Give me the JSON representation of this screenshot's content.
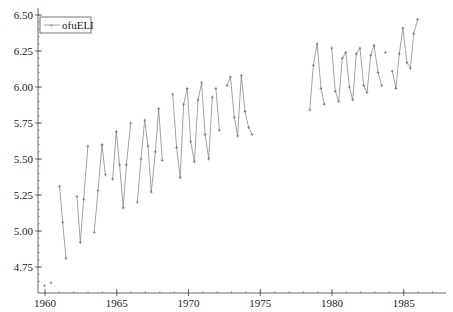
{
  "chart_data": {
    "type": "line",
    "title": "",
    "xlabel": "",
    "ylabel": "",
    "xlim": [
      1959.0,
      1987.6
    ],
    "ylim": [
      4.63,
      6.5
    ],
    "xticks": [
      1960,
      1965,
      1970,
      1975,
      1980,
      1985
    ],
    "xtick_labels": [
      "1960",
      "1965",
      "1970",
      "1975",
      "1980",
      "1985"
    ],
    "yticks": [
      4.75,
      5.0,
      5.25,
      5.5,
      5.75,
      6.0,
      6.25,
      6.5
    ],
    "ytick_labels": [
      "4.75",
      "5.00",
      "5.25",
      "5.50",
      "5.75",
      "6.00",
      "6.25",
      "6.50"
    ],
    "grid": false,
    "legend_position": "upper left",
    "series": [
      {
        "name": "ofuELI",
        "color": "#8a8a8a",
        "marker": "+",
        "segments": [
          {
            "x": [
              1959.96
            ],
            "y": [
              4.62
            ]
          },
          {
            "x": [
              1960.42
            ],
            "y": [
              4.64
            ]
          },
          {
            "x": [
              1961.02,
              1961.23,
              1961.46
            ],
            "y": [
              5.31,
              5.06,
              4.81
            ]
          },
          {
            "x": [
              1962.23,
              1962.46,
              1962.7,
              1962.99
            ],
            "y": [
              5.24,
              4.92,
              5.22,
              5.59
            ]
          },
          {
            "x": [
              1963.43,
              1963.69,
              1963.97,
              1964.21
            ],
            "y": [
              4.99,
              5.28,
              5.6,
              5.39
            ]
          },
          {
            "x": [
              1964.71,
              1964.97,
              1965.2,
              1965.45,
              1965.67,
              1965.97
            ],
            "y": [
              5.36,
              5.69,
              5.46,
              5.16,
              5.46,
              5.75
            ]
          },
          {
            "x": [
              1966.43,
              1966.69,
              1966.95,
              1967.18,
              1967.41,
              1967.69,
              1967.92,
              1968.17
            ],
            "y": [
              5.2,
              5.5,
              5.77,
              5.59,
              5.27,
              5.55,
              5.85,
              5.49
            ]
          },
          {
            "x": [
              1168.9,
              1969.17,
              1969.42,
              1969.66,
              1969.91,
              1970.15,
              1970.41,
              1970.66,
              1970.91,
              1971.16,
              1971.41,
              1971.66
            ],
            "y": [
              5.95,
              5.58,
              5.37,
              5.88,
              5.99,
              5.62,
              5.48,
              5.91,
              6.03,
              5.67,
              5.5,
              5.93
            ]
          },
          {
            "x": [
              1971.91,
              1972.15
            ],
            "y": [
              5.99,
              5.7
            ]
          },
          {
            "x": [
              1972.68,
              1972.92,
              1973.19,
              1973.42,
              1973.68,
              1973.94,
              1974.19,
              1974.43
            ],
            "y": [
              6.01,
              6.07,
              5.79,
              5.66,
              6.08,
              5.83,
              5.72,
              5.67
            ]
          },
          {
            "x": [
              1978.45,
              1978.7,
              1978.97,
              1979.23,
              1979.46
            ],
            "y": [
              5.84,
              6.15,
              6.3,
              5.99,
              5.88
            ]
          },
          {
            "x": [
              1979.98,
              1980.23,
              1980.47,
              1980.72,
              1980.96,
              1981.21,
              1981.44,
              1981.69,
              1981.95,
              1982.21,
              1982.44,
              1982.7,
              1982.93,
              1983.21,
              1983.46
            ],
            "y": [
              6.27,
              5.97,
              5.9,
              6.2,
              6.24,
              6.0,
              5.91,
              6.23,
              6.27,
              6.01,
              5.96,
              6.22,
              6.29,
              6.1,
              6.01
            ]
          },
          {
            "x": [
              1983.72
            ],
            "y": [
              6.24
            ]
          },
          {
            "x": [
              1984.2,
              1984.45,
              1984.69,
              1984.94,
              1985.22,
              1985.46,
              1985.69,
              1985.97
            ],
            "y": [
              6.11,
              5.99,
              6.23,
              6.41,
              6.17,
              6.13,
              6.37,
              6.47
            ]
          }
        ]
      }
    ]
  },
  "legend": {
    "label": "ofuELI"
  },
  "layout": {
    "plot_left": 38,
    "plot_right": 446,
    "plot_top": 8,
    "plot_bottom": 293,
    "x0_year": 1960,
    "x0_px": 45,
    "px_per_year": 14.35,
    "y0_value": 6.5,
    "y0_px": 15,
    "px_per_unit": 144
  }
}
